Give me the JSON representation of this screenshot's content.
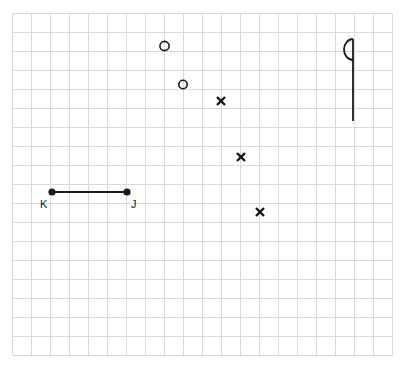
{
  "figure": {
    "background_color": "#ffffff",
    "grid": {
      "name": "square-grid",
      "line_color": "#d9d9d9",
      "cell_size_px": 19,
      "origin_x": 12,
      "origin_y": 13,
      "columns": 20,
      "rows": 18,
      "width_px": 380,
      "height_px": 342
    },
    "ink_color": "#1a1a1a",
    "segment": {
      "name": "segment-KJ",
      "label": "KJ",
      "stroke_width": 2,
      "endpoints": [
        {
          "label": "K",
          "x": 52,
          "y": 192,
          "dot_radius": 3.6,
          "label_x": 40,
          "label_y": 208
        },
        {
          "label": "J",
          "x": 127,
          "y": 192,
          "dot_radius": 3.6,
          "label_x": 131,
          "label_y": 208
        }
      ]
    },
    "open_circles": [
      {
        "name": "open-circle-1",
        "x": 164.5,
        "y": 46,
        "r": 4.6,
        "stroke_width": 1.6
      },
      {
        "name": "open-circle-2",
        "x": 183,
        "y": 84.5,
        "r": 4.2,
        "stroke_width": 1.6
      }
    ],
    "x_marks": [
      {
        "name": "x-mark-1",
        "x": 221,
        "y": 101,
        "arm": 3.4,
        "stroke_width": 2.2
      },
      {
        "name": "x-mark-2",
        "x": 241,
        "y": 157,
        "arm": 3.4,
        "stroke_width": 2.2
      },
      {
        "name": "x-mark-3",
        "x": 260,
        "y": 212,
        "arm": 3.4,
        "stroke_width": 2.2
      }
    ],
    "flag_symbol": {
      "name": "flag-symbol",
      "stem_x": 353,
      "stem_top_y": 39,
      "stem_bottom_y": 121,
      "arc_bottom_y": 60,
      "arc_left_x": 344,
      "stroke_width": 1.8
    }
  }
}
